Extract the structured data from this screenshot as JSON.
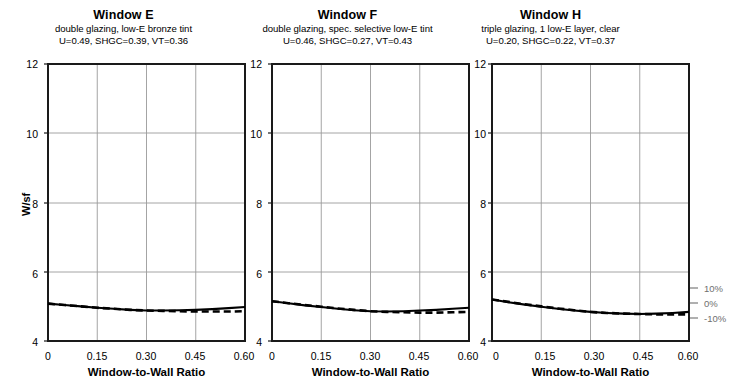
{
  "figure": {
    "panel_count": 3
  },
  "axis": {
    "ylabel": "W/sf",
    "xlabel": "Window-to-Wall Ratio",
    "y_ticks": [
      "4",
      "6",
      "8",
      "10",
      "12"
    ],
    "x_ticks": [
      "0",
      "0.15",
      "0.30",
      "0.45",
      "0.60"
    ],
    "ylim": [
      4,
      12
    ],
    "xlim": [
      0,
      0.6
    ],
    "grid": true
  },
  "annotations": {
    "pct_labels": [
      "10%",
      "0%",
      "-10%"
    ],
    "pct_values": [
      10,
      0,
      -10
    ],
    "color": "#6f6f6f"
  },
  "panels": [
    {
      "title": "Window E",
      "subtitle": "double glazing, low-E bronze tint",
      "properties": "U=0.49, SHGC=0.39, VT=0.36",
      "U": 0.49,
      "SHGC": 0.39,
      "VT": 0.36
    },
    {
      "title": "Window F",
      "subtitle": "double glazing, spec. selective low-E tint",
      "properties": "U=0.46, SHGC=0.27, VT=0.43",
      "U": 0.46,
      "SHGC": 0.27,
      "VT": 0.43
    },
    {
      "title": "Window H",
      "subtitle": "triple glazing, 1 low-E layer, clear",
      "properties": "U=0.20, SHGC=0.22, VT=0.37",
      "U": 0.2,
      "SHGC": 0.22,
      "VT": 0.37
    }
  ],
  "chart_data": {
    "type": "line",
    "title": "",
    "xlabel": "Window-to-Wall Ratio",
    "ylabel": "W/sf",
    "xlim": [
      0,
      0.6
    ],
    "ylim": [
      4,
      12
    ],
    "x_ticks": [
      0,
      0.15,
      0.3,
      0.45,
      0.6
    ],
    "y_ticks": [
      4,
      6,
      8,
      10,
      12
    ],
    "grid": true,
    "legend": "none",
    "x": [
      0,
      0.05,
      0.1,
      0.15,
      0.2,
      0.25,
      0.3,
      0.35,
      0.4,
      0.45,
      0.5,
      0.55,
      0.6
    ],
    "panels": [
      {
        "name": "Window E",
        "series": [
          {
            "name": "solid",
            "style": "solid",
            "values": [
              5.08,
              5.04,
              5.0,
              4.96,
              4.93,
              4.9,
              4.88,
              4.88,
              4.89,
              4.9,
              4.92,
              4.95,
              4.98
            ]
          },
          {
            "name": "dashed",
            "style": "dashed",
            "values": [
              5.08,
              5.04,
              5.0,
              4.96,
              4.93,
              4.9,
              4.88,
              4.87,
              4.86,
              4.85,
              4.85,
              4.85,
              4.86
            ]
          }
        ]
      },
      {
        "name": "Window F",
        "series": [
          {
            "name": "solid",
            "style": "solid",
            "values": [
              5.15,
              5.09,
              5.03,
              4.98,
              4.93,
              4.89,
              4.86,
              4.85,
              4.86,
              4.88,
              4.9,
              4.93,
              4.96
            ]
          },
          {
            "name": "dashed",
            "style": "dashed",
            "values": [
              5.15,
              5.09,
              5.04,
              4.99,
              4.94,
              4.9,
              4.86,
              4.84,
              4.83,
              4.82,
              4.82,
              4.83,
              4.84
            ]
          }
        ]
      },
      {
        "name": "Window H",
        "series": [
          {
            "name": "solid",
            "style": "solid",
            "values": [
              5.2,
              5.12,
              5.05,
              4.99,
              4.93,
              4.88,
              4.84,
              4.81,
              4.79,
              4.78,
              4.79,
              4.81,
              4.84
            ]
          },
          {
            "name": "dashed",
            "style": "dashed",
            "values": [
              5.2,
              5.13,
              5.06,
              5.0,
              4.94,
              4.89,
              4.84,
              4.81,
              4.79,
              4.78,
              4.77,
              4.77,
              4.77
            ]
          }
        ]
      }
    ]
  }
}
